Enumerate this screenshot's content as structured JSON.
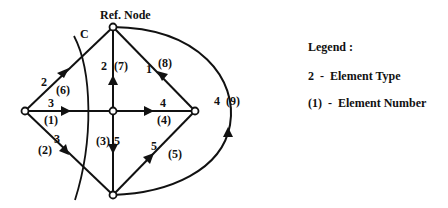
{
  "diagram": {
    "ref_node_label": "Ref. Node",
    "cut_label": "C",
    "nodes": [
      {
        "id": "top",
        "x": 113,
        "y": 27
      },
      {
        "id": "left",
        "x": 25,
        "y": 111
      },
      {
        "id": "center",
        "x": 113,
        "y": 111
      },
      {
        "id": "right",
        "x": 195,
        "y": 111
      },
      {
        "id": "bottom",
        "x": 113,
        "y": 195
      }
    ],
    "edges": [
      {
        "number": "(1)",
        "type": "3",
        "from": "left",
        "to": "center"
      },
      {
        "number": "(2)",
        "type": "3",
        "from": "left",
        "to": "bottom"
      },
      {
        "number": "(3)",
        "type": "5",
        "from": "center",
        "to": "bottom"
      },
      {
        "number": "(4)",
        "type": "4",
        "from": "center",
        "to": "right"
      },
      {
        "number": "(5)",
        "type": "5",
        "from": "bottom",
        "to": "right"
      },
      {
        "number": "(6)",
        "type": "2",
        "from": "left",
        "to": "top"
      },
      {
        "number": "(7)",
        "type": "2",
        "from": "center",
        "to": "top"
      },
      {
        "number": "(8)",
        "type": "1",
        "from": "right",
        "to": "top"
      },
      {
        "number": "(9)",
        "type": "4",
        "from": "bottom",
        "to": "top"
      }
    ],
    "labels": {
      "e1_type": "3",
      "e1_num": "(1)",
      "e2_type": "3",
      "e2_num": "(2)",
      "e3_type": "5",
      "e3_num": "(3)",
      "e4_type": "4",
      "e4_num": "(4)",
      "e5_type": "5",
      "e5_num": "(5)",
      "e6_type": "2",
      "e6_num": "(6)",
      "e7_type": "2",
      "e7_num": "(7)",
      "e8_type": "1",
      "e8_num": "(8)",
      "e9_type": "4",
      "e9_num": "(9)"
    }
  },
  "legend": {
    "title": "Legend :",
    "type_entry": "2  -  Element Type",
    "number_entry": "(1)  -  Element Number"
  }
}
